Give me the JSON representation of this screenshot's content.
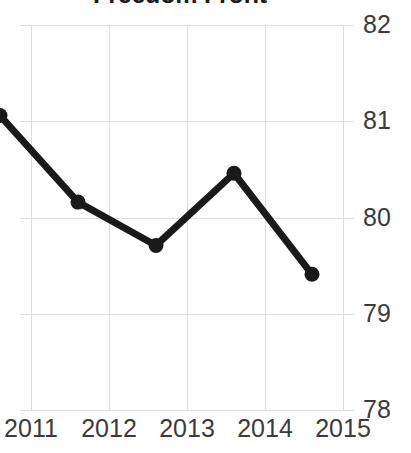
{
  "chart_data": {
    "type": "line",
    "title": "Freedom Front",
    "xlabel": "",
    "ylabel": "",
    "categories": [
      "2011",
      "2012",
      "2013",
      "2014",
      "2015"
    ],
    "x": [
      2011,
      2012,
      2013,
      2014,
      2015
    ],
    "values": [
      80.8,
      79.9,
      79.45,
      80.2,
      79.15
    ],
    "series": [
      {
        "name": "Freedom Front",
        "values": [
          80.8,
          79.9,
          79.45,
          80.2,
          79.15
        ]
      }
    ],
    "ylim": [
      78,
      82
    ],
    "yticks": [
      78,
      79,
      80,
      81,
      82
    ],
    "ytick_labels": [
      "78",
      "79",
      "80",
      "81",
      "82"
    ],
    "xticks": [
      2011,
      2012,
      2013,
      2014,
      2015
    ],
    "xtick_labels": [
      "2011",
      "2012",
      "2013",
      "2014",
      "2015"
    ],
    "grid": true,
    "grid_axis": "both",
    "legend": false,
    "legend_position": "none",
    "markers": true,
    "marker_shape": "circle",
    "line_color": "#1a1a1a",
    "marker_color": "#1a1a1a",
    "grid_color": "#dedede",
    "tick_label_color": "#3b3b3b",
    "title_color": "#1a1a1a",
    "background_color": "#ffffff",
    "y_axis_side": "right",
    "line_width_px": 7,
    "marker_radius_px": 7.5
  }
}
